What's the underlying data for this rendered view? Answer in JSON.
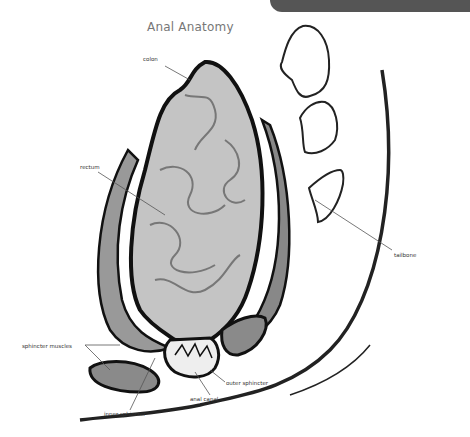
{
  "header": {
    "title": "Anal Anatomy"
  },
  "labels": {
    "colon": "colon",
    "rectum": "rectum",
    "tailbone": "tailbone",
    "sphincter_muscles": "sphincter muscles",
    "outer_sphincter": "outer sphincter",
    "anal_canal": "anal canal",
    "inner_sphincter": "inner sphincter"
  },
  "colors": {
    "topbar": "#555555",
    "title": "#777777",
    "outline": "#1a1a1a",
    "tissue": "#bdbdbd",
    "muscle": "#8a8a8a"
  }
}
